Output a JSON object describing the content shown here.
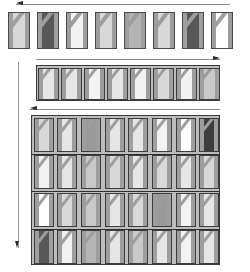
{
  "figure": {
    "background": "#ffffff",
    "width": 250,
    "height": 272,
    "palette": {
      "tile_border": "#4a4a4a",
      "band": "#9e9e9e",
      "frame_border": "#3a3a3a",
      "frame_background": "#bdbdbd",
      "arrow_shaft": "#8a8a8a",
      "arrow_head": "#2b2b2b"
    },
    "grays": {
      "white": "#ffffff",
      "g1": "#f2f2f2",
      "g2": "#e6e6e6",
      "g3": "#d8d8d8",
      "g4": "#c9c9c9",
      "g5": "#b4b4b4",
      "g6": "#9a9a9a",
      "g7": "#7a7a7a",
      "g8": "#585858",
      "g9": "#3d3d3d"
    }
  },
  "arrows": [
    {
      "name": "top-arrow",
      "direction": "left",
      "x": 16,
      "y": 3,
      "length": 214
    },
    {
      "name": "strip-arrow",
      "direction": "right",
      "x": 36,
      "y": 58,
      "length": 184
    },
    {
      "name": "grid-arrow",
      "direction": "left",
      "x": 30,
      "y": 108,
      "length": 190
    },
    {
      "name": "vertical-arrow",
      "direction": "down",
      "x": 17,
      "y": 62,
      "length": 186
    }
  ],
  "top_row": {
    "name": "prototile-row",
    "x": 8,
    "y": 12,
    "tile_width": 22,
    "tile_height": 37,
    "gap": 7,
    "tiles": [
      {
        "fill": "#d8d8d8",
        "label": "t1"
      },
      {
        "fill": "#585858",
        "label": "t2"
      },
      {
        "fill": "#f2f2f2",
        "label": "t3"
      },
      {
        "fill": "#d8d8d8",
        "label": "t4"
      },
      {
        "fill": "#b4b4b4",
        "label": "t5"
      },
      {
        "fill": "#d8d8d8",
        "label": "t6"
      },
      {
        "fill": "#585858",
        "label": "t7"
      },
      {
        "fill": "#ffffff",
        "label": "t8"
      }
    ]
  },
  "strip": {
    "name": "tile-strip",
    "x": 36,
    "y": 65,
    "width": 184,
    "height": 36,
    "tile_width": 21,
    "tile_height": 32,
    "tiles": [
      {
        "fill": "#e6e6e6"
      },
      {
        "fill": "#e6e6e6"
      },
      {
        "fill": "#f2f2f2"
      },
      {
        "fill": "#e6e6e6"
      },
      {
        "fill": "#f2f2f2"
      },
      {
        "fill": "#d8d8d8"
      },
      {
        "fill": "#f2f2f2"
      },
      {
        "fill": "#c9c9c9"
      }
    ]
  },
  "grid": {
    "name": "tile-grid",
    "x": 31,
    "y": 115,
    "width": 189,
    "height": 150,
    "columns": 8,
    "rows": 4,
    "cell_width": 23.6,
    "cell_height": 37.5,
    "tile_width": 20,
    "tile_height": 34,
    "rows_data": [
      {
        "row": 1,
        "tiles": [
          {
            "fill": "#d8d8d8"
          },
          {
            "fill": "#e6e6e6"
          },
          {
            "fill": "#9a9a9a"
          },
          {
            "fill": "#e6e6e6"
          },
          {
            "fill": "#e6e6e6"
          },
          {
            "fill": "#f2f2f2"
          },
          {
            "fill": "#ffffff"
          },
          {
            "fill": "#3d3d3d"
          }
        ]
      },
      {
        "row": 2,
        "tiles": [
          {
            "fill": "#f2f2f2"
          },
          {
            "fill": "#e6e6e6"
          },
          {
            "fill": "#c9c9c9"
          },
          {
            "fill": "#d8d8d8"
          },
          {
            "fill": "#e6e6e6"
          },
          {
            "fill": "#d8d8d8"
          },
          {
            "fill": "#e6e6e6"
          },
          {
            "fill": "#d8d8d8"
          }
        ]
      },
      {
        "row": 3,
        "tiles": [
          {
            "fill": "#ffffff"
          },
          {
            "fill": "#d8d8d8"
          },
          {
            "fill": "#c9c9c9"
          },
          {
            "fill": "#e6e6e6"
          },
          {
            "fill": "#d8d8d8"
          },
          {
            "fill": "#9a9a9a"
          },
          {
            "fill": "#f2f2f2"
          },
          {
            "fill": "#e6e6e6"
          }
        ]
      },
      {
        "row": 4,
        "tiles": [
          {
            "fill": "#585858"
          },
          {
            "fill": "#f2f2f2"
          },
          {
            "fill": "#b4b4b4"
          },
          {
            "fill": "#e6e6e6"
          },
          {
            "fill": "#c9c9c9"
          },
          {
            "fill": "#e6e6e6"
          },
          {
            "fill": "#f2f2f2"
          },
          {
            "fill": "#e6e6e6"
          }
        ]
      }
    ]
  }
}
